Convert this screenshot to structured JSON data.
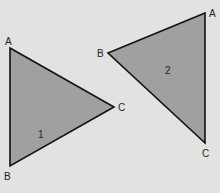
{
  "diagram": {
    "background": "#e2e2e0",
    "fill": "#a0a0a0",
    "stroke": "#111111",
    "triangles": [
      {
        "id": "1",
        "label": "1",
        "vertices": {
          "A": [
            10,
            48
          ],
          "B": [
            10,
            166
          ],
          "C": [
            114,
            107
          ]
        },
        "label_pos": [
          40,
          138
        ]
      },
      {
        "id": "2",
        "label": "2",
        "vertices": {
          "A": [
            205,
            13
          ],
          "B": [
            108,
            53
          ],
          "C": [
            205,
            143
          ]
        },
        "label_pos": [
          168,
          73
        ]
      }
    ],
    "vertex_labels": {
      "t1_A": "A",
      "t1_B": "B",
      "t1_C": "C",
      "t2_A": "A",
      "t2_B": "B",
      "t2_C": "C"
    }
  }
}
